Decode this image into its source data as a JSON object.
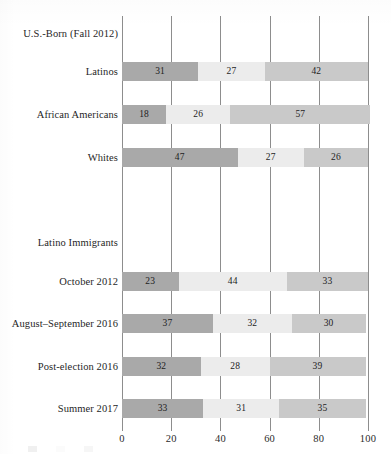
{
  "chart_data": {
    "type": "bar",
    "orientation": "horizontal",
    "stacked": true,
    "stack_total": 100,
    "title": "",
    "xlabel": "",
    "ylabel": "",
    "xlim": [
      0,
      100
    ],
    "xticks": [
      0,
      20,
      40,
      60,
      80,
      100
    ],
    "xticklabels": [
      "0",
      "20",
      "40",
      "60",
      "80",
      "100"
    ],
    "grid": true,
    "grid_axis": "x",
    "legend_position": "bottom",
    "legend_visible": false,
    "series": [
      {
        "name": "segment-1",
        "color": "#a9a9a9",
        "values": [
          31,
          18,
          47,
          23,
          37,
          32,
          33
        ]
      },
      {
        "name": "segment-2",
        "color": "#ececec",
        "values": [
          27,
          26,
          27,
          44,
          32,
          28,
          31
        ]
      },
      {
        "name": "segment-3",
        "color": "#c9c9c9",
        "values": [
          42,
          57,
          26,
          33,
          30,
          39,
          35
        ]
      }
    ],
    "categories": [
      "Latinos",
      "African Americans",
      "Whites",
      "October 2012",
      "August–September 2016",
      "Post-election 2016",
      "Summer 2017"
    ],
    "groups": [
      {
        "caption": "U.S.-Born (Fall 2012)",
        "categories": [
          "Latinos",
          "African Americans",
          "Whites"
        ]
      },
      {
        "caption": "Latino Immigrants",
        "categories": [
          "October 2012",
          "August–September 2016",
          "Post-election 2016",
          "Summer 2017"
        ]
      }
    ]
  },
  "chart": {
    "group_captions": [
      {
        "label": "U.S.-Born (Fall 2012)",
        "top": 28
      },
      {
        "label": "Latino Immigrants",
        "top": 237
      }
    ],
    "rows": [
      {
        "label": "Latinos",
        "top": 62,
        "segments": [
          {
            "value": 31,
            "label": "31",
            "start": 0,
            "color": "#a9a9a9"
          },
          {
            "value": 27,
            "label": "27",
            "start": 31,
            "color": "#ececec"
          },
          {
            "value": 42,
            "label": "42",
            "start": 58,
            "color": "#c9c9c9"
          }
        ]
      },
      {
        "label": "African Americans",
        "top": 105,
        "segments": [
          {
            "value": 18,
            "label": "18",
            "start": 0,
            "color": "#a9a9a9"
          },
          {
            "value": 26,
            "label": "26",
            "start": 18,
            "color": "#ececec"
          },
          {
            "value": 57,
            "label": "57",
            "start": 44,
            "color": "#c9c9c9"
          }
        ]
      },
      {
        "label": "Whites",
        "top": 148,
        "segments": [
          {
            "value": 47,
            "label": "47",
            "start": 0,
            "color": "#a9a9a9"
          },
          {
            "value": 27,
            "label": "27",
            "start": 47,
            "color": "#ececec"
          },
          {
            "value": 26,
            "label": "26",
            "start": 74,
            "color": "#c9c9c9"
          }
        ]
      },
      {
        "label": "October 2012",
        "top": 272,
        "segments": [
          {
            "value": 23,
            "label": "23",
            "start": 0,
            "color": "#a9a9a9"
          },
          {
            "value": 44,
            "label": "44",
            "start": 23,
            "color": "#ececec"
          },
          {
            "value": 33,
            "label": "33",
            "start": 67,
            "color": "#c9c9c9"
          }
        ]
      },
      {
        "label": "August–September 2016",
        "top": 314,
        "segments": [
          {
            "value": 37,
            "label": "37",
            "start": 0,
            "color": "#a9a9a9"
          },
          {
            "value": 32,
            "label": "32",
            "start": 37,
            "color": "#ececec"
          },
          {
            "value": 30,
            "label": "30",
            "start": 69,
            "color": "#c9c9c9"
          }
        ]
      },
      {
        "label": "Post-election 2016",
        "top": 357,
        "segments": [
          {
            "value": 32,
            "label": "32",
            "start": 0,
            "color": "#a9a9a9"
          },
          {
            "value": 28,
            "label": "28",
            "start": 32,
            "color": "#ececec"
          },
          {
            "value": 39,
            "label": "39",
            "start": 60,
            "color": "#c9c9c9"
          }
        ]
      },
      {
        "label": "Summer 2017",
        "top": 399,
        "segments": [
          {
            "value": 33,
            "label": "33",
            "start": 0,
            "color": "#a9a9a9"
          },
          {
            "value": 31,
            "label": "31",
            "start": 33,
            "color": "#ececec"
          },
          {
            "value": 35,
            "label": "35",
            "start": 64,
            "color": "#c9c9c9"
          }
        ]
      }
    ],
    "axis": {
      "ticks": [
        {
          "value": 0,
          "label": "0"
        },
        {
          "value": 20,
          "label": "20"
        },
        {
          "value": 40,
          "label": "40"
        },
        {
          "value": 60,
          "label": "60"
        },
        {
          "value": 80,
          "label": "80"
        },
        {
          "value": 100,
          "label": "100"
        }
      ]
    },
    "legend": [
      {
        "label": "",
        "color": "#a9a9a9"
      },
      {
        "label": "",
        "color": "#ececec"
      },
      {
        "label": "",
        "color": "#c9c9c9"
      }
    ]
  }
}
